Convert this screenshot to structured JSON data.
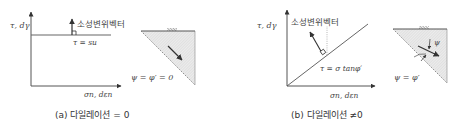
{
  "panel_a": {
    "y_axis_label": "τ, dγ",
    "x_axis_label": "σn, dεn",
    "vector_label": "소성변위벡터",
    "failure_line_label": "τ = su",
    "triangle_label": "ψ = φ′ = 0",
    "caption": "(a) 다일레이션 = 0"
  },
  "panel_b": {
    "y_axis_label": "τ, dγ",
    "x_axis_label": "σn, dεn",
    "vector_label": "소성변위벡터",
    "failure_line_label": "τ = σ tanφ′",
    "triangle_angle_label": "ψ",
    "triangle_label": "ψ = φ′",
    "caption": "(b) 다일레이션 ≠0"
  },
  "colors": {
    "axis": "#555555",
    "line": "#666666",
    "hatch_fill": "#e6e6e6",
    "text": "#444444"
  }
}
